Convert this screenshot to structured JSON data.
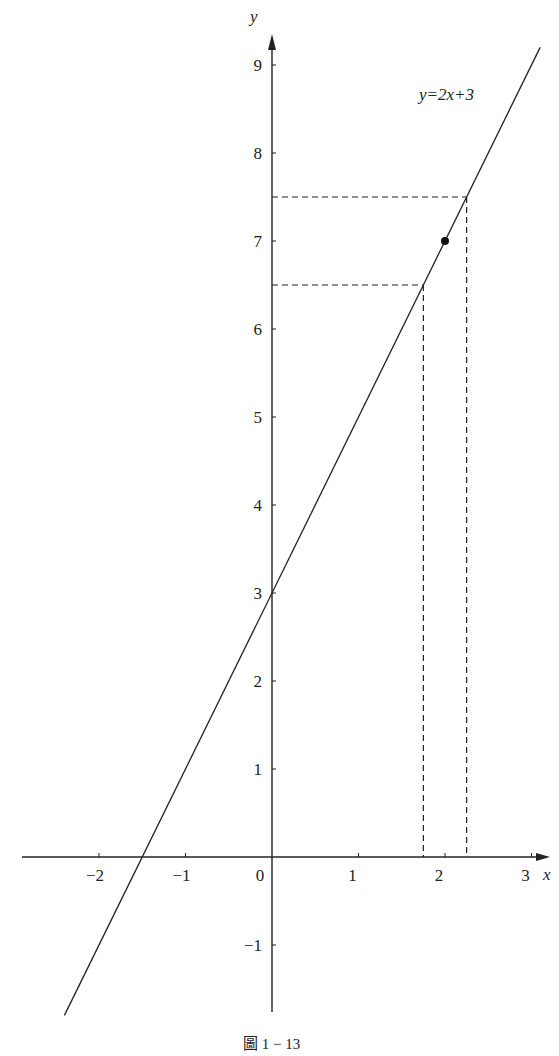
{
  "chart_data": {
    "type": "line",
    "title": "",
    "caption": "圖 1 − 13",
    "xlabel": "x",
    "ylabel": "y",
    "xlim": [
      -2.9,
      3.2
    ],
    "ylim": [
      -1.8,
      9.3
    ],
    "grid": false,
    "x_ticks": [
      -2,
      -1,
      0,
      1,
      2,
      3
    ],
    "x_tick_labels": [
      "−2",
      "−1",
      "0",
      "1",
      "2",
      "3"
    ],
    "y_ticks": [
      -1,
      1,
      2,
      3,
      4,
      5,
      6,
      7,
      8,
      9
    ],
    "y_tick_labels": [
      "−1",
      "1",
      "2",
      "3",
      "4",
      "5",
      "6",
      "7",
      "8",
      "9"
    ],
    "series": [
      {
        "name": "y=2x+3",
        "slope": 2,
        "intercept": 3,
        "x_range": [
          -2.4,
          3.1
        ],
        "label": "y=2x+3"
      }
    ],
    "points": [
      {
        "x": 2,
        "y": 7
      }
    ],
    "dashed_guides": [
      {
        "x": 1.75,
        "y": 6.5
      },
      {
        "x": 2.25,
        "y": 7.5
      }
    ],
    "line_label": {
      "text": "y=2x+3",
      "x": 1.7,
      "y": 8.6
    }
  }
}
